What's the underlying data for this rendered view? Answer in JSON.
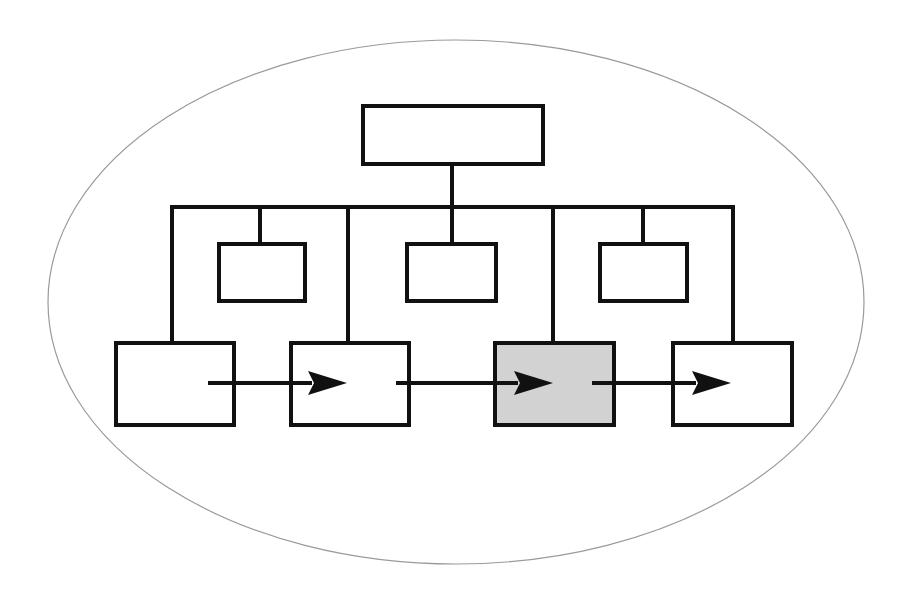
{
  "diagram": {
    "title": "",
    "type": "hierarchy-with-flow",
    "colors": {
      "background": "#ffffff",
      "ellipse_stroke": "#9a9a9a",
      "line": "#111111",
      "box_fill": "#ffffff",
      "highlight_fill": "#d2d2d2"
    },
    "nodes": {
      "root": {
        "label": "",
        "highlighted": false
      },
      "mid": [
        {
          "label": "",
          "highlighted": false
        },
        {
          "label": "",
          "highlighted": false
        },
        {
          "label": "",
          "highlighted": false
        }
      ],
      "bottom": [
        {
          "label": "",
          "highlighted": false
        },
        {
          "label": "",
          "highlighted": false
        },
        {
          "label": "",
          "highlighted": true
        },
        {
          "label": "",
          "highlighted": false
        }
      ]
    },
    "flow_arrows": [
      {
        "from": "bottom-1",
        "to": "bottom-2"
      },
      {
        "from": "bottom-2",
        "to": "bottom-3"
      },
      {
        "from": "bottom-3",
        "to": "bottom-4"
      }
    ]
  }
}
